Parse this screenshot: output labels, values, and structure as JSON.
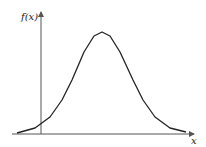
{
  "chart_data": {
    "type": "line",
    "title": "",
    "xlabel": "x",
    "ylabel": "f(x)",
    "grid": false,
    "legend": null,
    "x": [
      -1.0,
      -0.3,
      0.3,
      0.8,
      1.2,
      1.7,
      2.1,
      2.4,
      2.7,
      3.1,
      3.6,
      4.0,
      4.5,
      5.1,
      5.7
    ],
    "y": [
      0.01,
      0.05,
      0.16,
      0.32,
      0.52,
      0.79,
      0.94,
      0.98,
      0.94,
      0.79,
      0.52,
      0.32,
      0.16,
      0.05,
      0.01
    ],
    "points_px": [
      [
        17,
        133
      ],
      [
        35,
        128
      ],
      [
        50,
        117
      ],
      [
        62,
        100
      ],
      [
        72,
        80
      ],
      [
        84,
        52
      ],
      [
        94,
        36
      ],
      [
        102,
        32
      ],
      [
        110,
        36
      ],
      [
        120,
        52
      ],
      [
        133,
        80
      ],
      [
        143,
        100
      ],
      [
        155,
        117
      ],
      [
        170,
        128
      ],
      [
        186,
        132
      ]
    ],
    "axes": {
      "x_axis": {
        "x1": 12,
        "x2": 194,
        "y": 134
      },
      "y_axis": {
        "x": 41,
        "y1": 134,
        "y2": 12
      }
    }
  },
  "labels": {
    "y_axis": "f(x)",
    "x_axis": "x"
  },
  "colors": {
    "axis": "#555555",
    "curve": "#222222"
  }
}
